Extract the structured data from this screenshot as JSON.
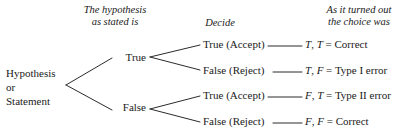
{
  "figure": {
    "background_color": "#ffffff",
    "line_color": "#2b2b2b",
    "text_color": "#1a1a1a"
  },
  "headers": {
    "hypothesis": "The hypothesis\nas stated is",
    "hypothesis_line1": "The hypothesis",
    "hypothesis_line2": "as stated is",
    "decide": "Decide",
    "outcome_line1": "As it turned out",
    "outcome_line2": "the choice was"
  },
  "root": {
    "line1": "Hypothesis",
    "line2": "or",
    "line3": "Statement"
  },
  "level1": [
    {
      "label": "True"
    },
    {
      "label": "False"
    }
  ],
  "decisions": [
    {
      "label": "True (Accept)"
    },
    {
      "label": "False (Reject)"
    },
    {
      "label": "True (Accept)"
    },
    {
      "label": "False (Reject)"
    }
  ],
  "outcomes": [
    {
      "first": "T",
      "sep": ", ",
      "second": "T",
      "equals": " = ",
      "result": "Correct"
    },
    {
      "first": "T",
      "sep": ", ",
      "second": "F",
      "equals": " = ",
      "result": "Type I error"
    },
    {
      "first": "F",
      "sep": ", ",
      "second": "T",
      "equals": " = ",
      "result": "Type II error"
    },
    {
      "first": "F",
      "sep": ", ",
      "second": "F",
      "equals": " = ",
      "result": "Correct"
    }
  ]
}
